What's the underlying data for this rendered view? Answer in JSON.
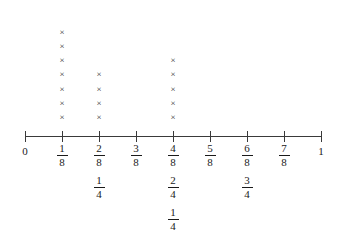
{
  "chart_data": {
    "type": "dotplot",
    "title": "",
    "subtitle": "",
    "xlabel": "",
    "ylabel": "",
    "mark_glyph": "×",
    "grid": false,
    "legend": null,
    "xlim": [
      0,
      1
    ],
    "axis": {
      "start_label": "0",
      "end_label": "1",
      "tick_count": 9,
      "denominator": 8
    },
    "categories": [
      "0",
      "1/8",
      "2/8",
      "3/8",
      "4/8",
      "5/8",
      "6/8",
      "7/8",
      "1"
    ],
    "x": [
      0,
      0.125,
      0.25,
      0.375,
      0.5,
      0.625,
      0.75,
      0.875,
      1
    ],
    "values": [
      0,
      7,
      4,
      0,
      5,
      0,
      0,
      0,
      0
    ],
    "ticks": [
      {
        "position": 0,
        "labels": [
          {
            "kind": "whole",
            "text": "0"
          }
        ],
        "marks": 0
      },
      {
        "position": 0.125,
        "labels": [
          {
            "kind": "fraction",
            "numerator": "1",
            "denominator": "8",
            "text": "1/8"
          }
        ],
        "marks": 7
      },
      {
        "position": 0.25,
        "labels": [
          {
            "kind": "fraction",
            "numerator": "2",
            "denominator": "8",
            "text": "2/8"
          },
          {
            "kind": "fraction",
            "numerator": "1",
            "denominator": "4",
            "text": "1/4"
          }
        ],
        "marks": 4
      },
      {
        "position": 0.375,
        "labels": [
          {
            "kind": "fraction",
            "numerator": "3",
            "denominator": "8",
            "text": "3/8"
          }
        ],
        "marks": 0
      },
      {
        "position": 0.5,
        "labels": [
          {
            "kind": "fraction",
            "numerator": "4",
            "denominator": "8",
            "text": "4/8"
          },
          {
            "kind": "fraction",
            "numerator": "2",
            "denominator": "4",
            "text": "2/4"
          },
          {
            "kind": "fraction",
            "numerator": "1",
            "denominator": "4",
            "text": "1/4"
          }
        ],
        "marks": 5
      },
      {
        "position": 0.625,
        "labels": [
          {
            "kind": "fraction",
            "numerator": "5",
            "denominator": "8",
            "text": "5/8"
          }
        ],
        "marks": 0
      },
      {
        "position": 0.75,
        "labels": [
          {
            "kind": "fraction",
            "numerator": "6",
            "denominator": "8",
            "text": "6/8"
          },
          {
            "kind": "fraction",
            "numerator": "3",
            "denominator": "4",
            "text": "3/4"
          }
        ],
        "marks": 0
      },
      {
        "position": 0.875,
        "labels": [
          {
            "kind": "fraction",
            "numerator": "7",
            "denominator": "8",
            "text": "7/8"
          }
        ],
        "marks": 0
      },
      {
        "position": 1,
        "labels": [
          {
            "kind": "whole",
            "text": "1"
          }
        ],
        "marks": 0
      }
    ],
    "colors": {
      "axis": "#3a3a3a",
      "mark": "#2e2e2e",
      "text": "#1a1a1a",
      "background": "#ffffff"
    }
  },
  "layout": {
    "axis_y": 136,
    "axis_x_start": 25,
    "axis_x_end": 321,
    "tick_half_height": 5,
    "mark_bottom_y": 117,
    "mark_row_spacing": 14.2,
    "label_top_y": 143
  }
}
